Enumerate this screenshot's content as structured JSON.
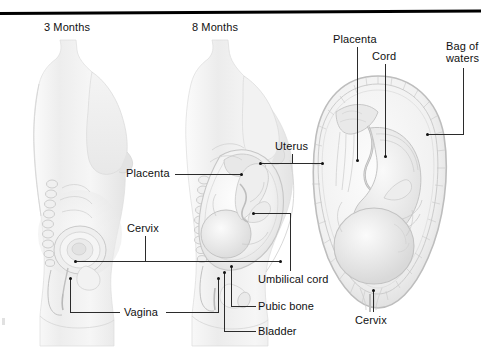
{
  "figure": {
    "type": "medical-illustration",
    "style": "grayscale pencil rendering on white background",
    "top_rule_color": "#000000"
  },
  "stage_titles": [
    {
      "label": "3 Months"
    },
    {
      "label": "8 Months"
    }
  ],
  "labels": [
    {
      "id": "placenta-top",
      "label": "Placenta"
    },
    {
      "id": "cord",
      "label": "Cord"
    },
    {
      "id": "bag-of-waters",
      "label": "Bag of\nwaters",
      "line1": "Bag of",
      "line2": "waters"
    },
    {
      "id": "uterus",
      "label": "Uterus"
    },
    {
      "id": "placenta-left",
      "label": "Placenta"
    },
    {
      "id": "cervix-left",
      "label": "Cervix"
    },
    {
      "id": "umbilical-cord",
      "label": "Umbilical cord"
    },
    {
      "id": "vagina",
      "label": "Vagina"
    },
    {
      "id": "pubic-bone",
      "label": "Pubic bone"
    },
    {
      "id": "bladder",
      "label": "Bladder"
    },
    {
      "id": "cervix-right",
      "label": "Cervix"
    }
  ],
  "colors": {
    "text": "#111111",
    "leader_line": "#2b2b2b",
    "rule": "#000000",
    "artwork_light": "#f2f2f2",
    "artwork_mid": "#d8d8d8",
    "artwork_dark": "#a9a9a9"
  }
}
